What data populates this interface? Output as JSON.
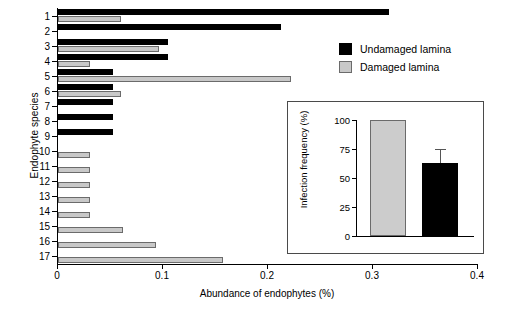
{
  "chart_data": {
    "type": "bar",
    "orientation": "horizontal",
    "title": "",
    "xlabel": "Abundance of endophytes (%)",
    "ylabel": "Endophyte species",
    "xlim": [
      0,
      0.4
    ],
    "xticks": [
      "0",
      "0.1",
      "0.2",
      "0.3",
      "0.4"
    ],
    "xtick_values": [
      0,
      0.1,
      0.2,
      0.3,
      0.4
    ],
    "grid": false,
    "legend_position": "top-right",
    "categories": [
      "1",
      "2",
      "3",
      "4",
      "5",
      "6",
      "7",
      "8",
      "9",
      "10",
      "11",
      "12",
      "13",
      "14",
      "15",
      "16",
      "17"
    ],
    "series": [
      {
        "name": "Undamaged lamina",
        "color": "#000000",
        "values": [
          0.315,
          0.212,
          0.105,
          0.105,
          0.052,
          0.052,
          0.052,
          0.052,
          0.052,
          0,
          0,
          0,
          0,
          0,
          0,
          0,
          0
        ]
      },
      {
        "name": "Damaged lamina",
        "color": "#c8c8c8",
        "values": [
          0.06,
          0,
          0.096,
          0.03,
          0.222,
          0.06,
          0,
          0,
          0,
          0.03,
          0.03,
          0.03,
          0.03,
          0.03,
          0.062,
          0.093,
          0.157
        ]
      }
    ]
  },
  "legend": {
    "items": [
      {
        "label": "Undamaged lamina",
        "color": "#000000"
      },
      {
        "label": "Damaged lamina",
        "color": "#c8c8c8"
      }
    ]
  },
  "inset_chart": {
    "type": "bar",
    "title": "",
    "ylabel": "Infection frequency (%)",
    "xlabel": "",
    "ylim": [
      0,
      100
    ],
    "yticks": [
      "0",
      "25",
      "50",
      "75",
      "100"
    ],
    "ytick_values": [
      0,
      25,
      50,
      75,
      100
    ],
    "grid": false,
    "categories": [
      "Damaged lamina",
      "Undamaged lamina"
    ],
    "bars": [
      {
        "name": "Damaged lamina",
        "color": "#c8c8c8",
        "value": 100,
        "error": 0
      },
      {
        "name": "Undamaged lamina",
        "color": "#000000",
        "value": 63,
        "error": 12
      }
    ]
  }
}
